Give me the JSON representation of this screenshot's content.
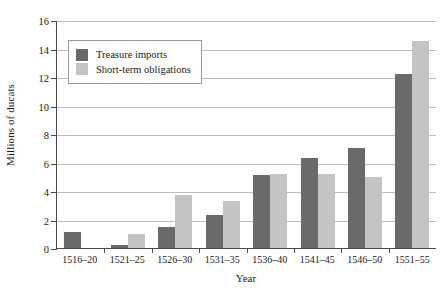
{
  "chart_data": {
    "type": "bar",
    "title": "",
    "xlabel": "Year",
    "ylabel": "Millions of ducats",
    "categories": [
      "1516–20",
      "1521–25",
      "1526–30",
      "1531–35",
      "1536–40",
      "1541–45",
      "1546–50",
      "1551–55"
    ],
    "series": [
      {
        "name": "Treasure imports",
        "color": "#6a6a6a",
        "values": [
          1.1,
          0.2,
          1.5,
          2.3,
          5.1,
          6.3,
          7.0,
          12.2
        ]
      },
      {
        "name": "Short-term obligations",
        "color": "#c4c4c4",
        "values": [
          0.0,
          1.0,
          3.7,
          3.3,
          5.2,
          5.2,
          5.0,
          14.5
        ]
      }
    ],
    "ylim": [
      0,
      16
    ],
    "yticks": [
      0,
      2,
      4,
      6,
      8,
      10,
      12,
      14,
      16
    ],
    "ytick_labels": [
      "0",
      "2",
      "4",
      "6",
      "8",
      "10",
      "12",
      "14",
      "16"
    ],
    "grid": "horizontal",
    "legend_position": "upper-left-inside"
  },
  "legend": {
    "items": [
      {
        "label": "Treasure imports"
      },
      {
        "label": "Short-term obligations"
      }
    ]
  }
}
